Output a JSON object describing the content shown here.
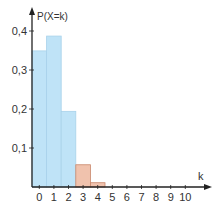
{
  "chart_data": {
    "type": "bar",
    "title": "",
    "xlabel": "k",
    "ylabel": "P(X=k)",
    "categories": [
      "0",
      "1",
      "2",
      "3",
      "4",
      "5",
      "6",
      "7",
      "8",
      "9",
      "10"
    ],
    "values": [
      0.349,
      0.387,
      0.194,
      0.057,
      0.011,
      0.001,
      0.0,
      0.0,
      0.0,
      0.0,
      0.0
    ],
    "bar_colors": [
      "#bfe3f7",
      "#bfe3f7",
      "#bfe3f7",
      "#f0c2ad",
      "#f0c2ad",
      "#f0c2ad",
      "#f0c2ad",
      "#f0c2ad",
      "#f0c2ad",
      "#f0c2ad",
      "#f0c2ad"
    ],
    "ylim": [
      0,
      0.43
    ],
    "yticks": [
      0.1,
      0.2,
      0.3,
      0.4
    ],
    "ytick_labels": [
      "0,1",
      "0,2",
      "0,3",
      "0,4"
    ],
    "grid": false,
    "legend": null
  },
  "colors": {
    "bar_light": "#bfe3f7",
    "bar_light_stroke": "#a8d2ea",
    "bar_highlight": "#f0c2ad",
    "bar_highlight_stroke": "#c9866a",
    "axis": "#222222"
  }
}
